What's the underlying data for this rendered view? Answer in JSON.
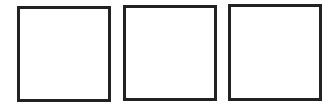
{
  "canvas": {
    "width": 334,
    "height": 111,
    "background": "#ffffff"
  },
  "boxes": [
    {
      "label": "",
      "x": 17,
      "y": 6,
      "width": 94,
      "height": 96,
      "border_width": 3,
      "border_color": "#222222",
      "fill": "#ffffff"
    },
    {
      "label": "",
      "x": 123,
      "y": 5,
      "width": 94,
      "height": 96,
      "border_width": 3,
      "border_color": "#222222",
      "fill": "#ffffff"
    },
    {
      "label": "",
      "x": 228,
      "y": 4,
      "width": 94,
      "height": 97,
      "border_width": 3,
      "border_color": "#222222",
      "fill": "#ffffff"
    }
  ]
}
